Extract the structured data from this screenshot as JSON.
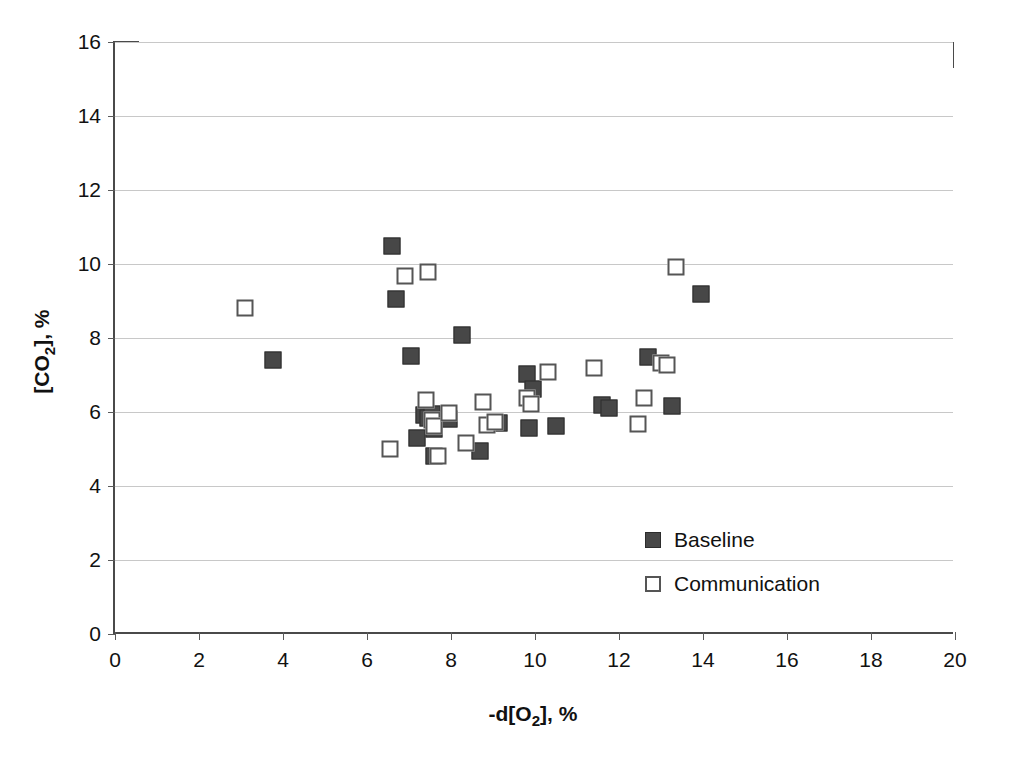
{
  "chart_data": {
    "type": "scatter",
    "title": "",
    "xlabel": "-d[O2], %",
    "xlabel_html": "-d[O<sub>2</sub>], %",
    "ylabel": "[CO2], %",
    "ylabel_html": "[CO<sub>2</sub>], %",
    "xlim": [
      0,
      20
    ],
    "ylim": [
      0,
      16
    ],
    "xticks": [
      0,
      2,
      4,
      6,
      8,
      10,
      12,
      14,
      16,
      18,
      20
    ],
    "yticks": [
      0,
      2,
      4,
      6,
      8,
      10,
      12,
      14,
      16
    ],
    "grid": "horizontal",
    "legend_position": "inside-lower-right",
    "series": [
      {
        "name": "Baseline",
        "marker": "filled-square",
        "color": "#474747",
        "points": [
          [
            3.75,
            7.4
          ],
          [
            6.6,
            10.48
          ],
          [
            6.7,
            9.05
          ],
          [
            7.05,
            7.52
          ],
          [
            7.2,
            5.3
          ],
          [
            7.35,
            5.92
          ],
          [
            7.45,
            5.85
          ],
          [
            7.55,
            5.95
          ],
          [
            7.6,
            5.55
          ],
          [
            7.6,
            4.82
          ],
          [
            7.95,
            5.8
          ],
          [
            8.25,
            8.08
          ],
          [
            8.7,
            4.95
          ],
          [
            9.15,
            5.7
          ],
          [
            9.8,
            7.02
          ],
          [
            9.85,
            5.58
          ],
          [
            9.95,
            6.62
          ],
          [
            10.5,
            5.62
          ],
          [
            11.6,
            6.2
          ],
          [
            11.75,
            6.12
          ],
          [
            12.7,
            7.5
          ],
          [
            13.25,
            6.15
          ],
          [
            13.95,
            9.18
          ]
        ]
      },
      {
        "name": "Communication",
        "marker": "open-square",
        "color": "#555555",
        "points": [
          [
            3.1,
            8.82
          ],
          [
            6.55,
            5.0
          ],
          [
            6.9,
            9.67
          ],
          [
            7.45,
            9.78
          ],
          [
            7.4,
            6.32
          ],
          [
            7.55,
            5.78
          ],
          [
            7.6,
            5.62
          ],
          [
            7.7,
            4.82
          ],
          [
            7.95,
            5.98
          ],
          [
            8.35,
            5.15
          ],
          [
            8.75,
            6.28
          ],
          [
            8.85,
            5.65
          ],
          [
            9.05,
            5.72
          ],
          [
            9.8,
            6.38
          ],
          [
            9.9,
            6.22
          ],
          [
            10.3,
            7.08
          ],
          [
            11.4,
            7.18
          ],
          [
            12.45,
            5.67
          ],
          [
            12.6,
            6.38
          ],
          [
            13.0,
            7.32
          ],
          [
            13.15,
            7.28
          ],
          [
            13.35,
            9.92
          ]
        ]
      }
    ]
  },
  "legend": {
    "items": [
      {
        "label": "Baseline",
        "marker": "filled-square"
      },
      {
        "label": "Communication",
        "marker": "open-square"
      }
    ]
  }
}
